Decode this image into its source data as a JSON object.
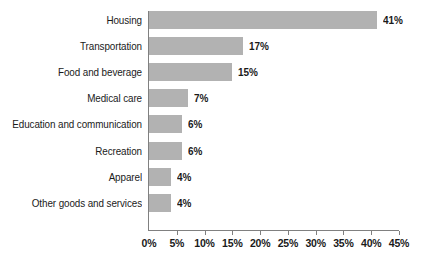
{
  "chart_data": {
    "type": "bar",
    "orientation": "horizontal",
    "title": "",
    "subtitle": "",
    "xlabel": "",
    "ylabel": "",
    "xlim": [
      0,
      45
    ],
    "xticks": [
      "0%",
      "5%",
      "10%",
      "15%",
      "20%",
      "25%",
      "30%",
      "35%",
      "40%",
      "45%"
    ],
    "xtick_values": [
      0,
      5,
      10,
      15,
      20,
      25,
      30,
      35,
      40,
      45
    ],
    "grid": false,
    "legend": false,
    "legend_position": "none",
    "bar_color": "#b2b2b2",
    "axis_color": "#808080",
    "text_color": "#1a1a1a",
    "background_color": "#ffffff",
    "categories": [
      "Housing",
      "Transportation",
      "Food and beverage",
      "Medical care",
      "Education and communication",
      "Recreation",
      "Apparel",
      "Other goods and services"
    ],
    "values": [
      41,
      17,
      15,
      7,
      6,
      6,
      4,
      4
    ],
    "data_labels": [
      "41%",
      "17%",
      "15%",
      "7%",
      "6%",
      "6%",
      "4%",
      "4%"
    ],
    "points": [
      {
        "category": "Housing",
        "value": 41,
        "label": "41%"
      },
      {
        "category": "Transportation",
        "value": 17,
        "label": "17%"
      },
      {
        "category": "Food and beverage",
        "value": 15,
        "label": "15%"
      },
      {
        "category": "Medical care",
        "value": 7,
        "label": "7%"
      },
      {
        "category": "Education and communication",
        "value": 6,
        "label": "6%"
      },
      {
        "category": "Recreation",
        "value": 6,
        "label": "6%"
      },
      {
        "category": "Apparel",
        "value": 4,
        "label": "4%"
      },
      {
        "category": "Other goods and services",
        "value": 4,
        "label": "4%"
      }
    ]
  }
}
